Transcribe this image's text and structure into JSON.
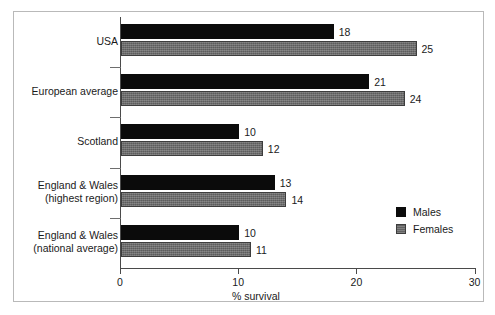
{
  "chart_data": {
    "type": "bar",
    "orientation": "horizontal",
    "title": "",
    "xlabel": "% survival",
    "ylabel": "",
    "xlim": [
      0,
      30
    ],
    "xticks": [
      0,
      10,
      20,
      30
    ],
    "xtick_labels": [
      "0",
      "10",
      "20",
      "30"
    ],
    "grid": false,
    "legend_position": "inside-right",
    "categories": [
      "USA",
      "European average",
      "Scotland",
      "England & Wales\n(highest region)",
      "England & Wales\n(national average)"
    ],
    "series": [
      {
        "name": "Males",
        "color": "#0b0b0b",
        "values": [
          18,
          21,
          10,
          13,
          10
        ]
      },
      {
        "name": "Females",
        "color": "#6f6f6f",
        "values": [
          25,
          24,
          12,
          14,
          11
        ]
      }
    ]
  },
  "legend": {
    "items": [
      {
        "label": "Males",
        "swatch": "males"
      },
      {
        "label": "Females",
        "swatch": "females"
      }
    ]
  }
}
